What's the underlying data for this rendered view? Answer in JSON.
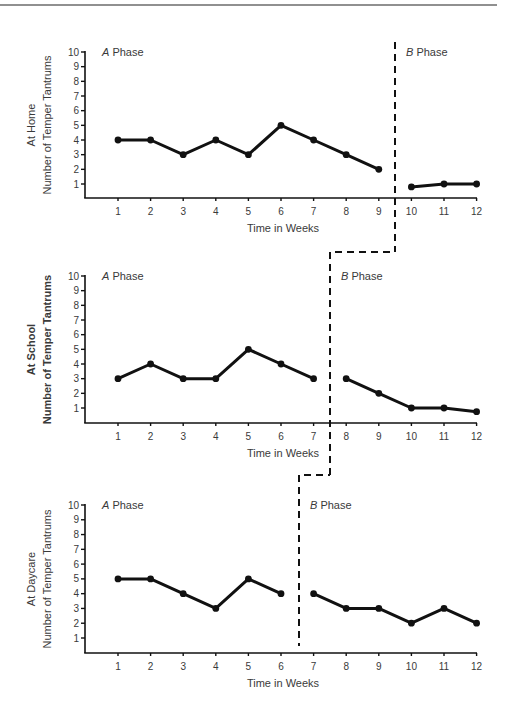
{
  "figure": {
    "top_rule_color": "#6b6b6b",
    "line_color": "#111111",
    "text_color": "#3a3a3a"
  },
  "chart_data": [
    {
      "type": "line",
      "title": "At Home",
      "ylabel_line1": "At Home",
      "ylabel_line2": "Number of Temper Tantrums",
      "ylabel_bold": false,
      "xlabel": "Time in Weeks",
      "ylim": [
        0,
        10
      ],
      "yticks": [
        1,
        2,
        3,
        4,
        5,
        6,
        7,
        8,
        9,
        10
      ],
      "xticks": [
        1,
        2,
        3,
        4,
        5,
        6,
        7,
        8,
        9,
        10,
        11,
        12
      ],
      "grid": false,
      "phase_change_after_week": 9,
      "phases": [
        {
          "name": "A Phase",
          "letter": "A",
          "suffix": " Phase",
          "weeks": [
            1,
            2,
            3,
            4,
            5,
            6,
            7,
            8,
            9
          ],
          "values": [
            4,
            4,
            3,
            4,
            3,
            5,
            4,
            3,
            2
          ]
        },
        {
          "name": "B Phase",
          "letter": "B",
          "suffix": " Phase",
          "weeks": [
            10,
            11,
            12
          ],
          "values": [
            0.8,
            1,
            1
          ]
        }
      ]
    },
    {
      "type": "line",
      "title": "At School",
      "ylabel_line1": "At School",
      "ylabel_line2": "Number of Temper Tantrums",
      "ylabel_bold": true,
      "xlabel": "Time in Weeks",
      "ylim": [
        0,
        10
      ],
      "yticks": [
        1,
        2,
        3,
        4,
        5,
        6,
        7,
        8,
        9,
        10
      ],
      "xticks": [
        1,
        2,
        3,
        4,
        5,
        6,
        7,
        8,
        9,
        10,
        11,
        12
      ],
      "grid": false,
      "phase_change_after_week": 7,
      "phases": [
        {
          "name": "A Phase",
          "letter": "A",
          "suffix": " Phase",
          "weeks": [
            1,
            2,
            3,
            4,
            5,
            6,
            7
          ],
          "values": [
            3,
            4,
            3,
            3,
            5,
            4,
            3
          ]
        },
        {
          "name": "B Phase",
          "letter": "B",
          "suffix": " Phase",
          "weeks": [
            8,
            9,
            10,
            11,
            12
          ],
          "values": [
            3,
            2,
            1,
            1,
            0.75
          ]
        }
      ]
    },
    {
      "type": "line",
      "title": "At Daycare",
      "ylabel_line1": "At Daycare",
      "ylabel_line2": "Number of Temper Tantrums",
      "ylabel_bold": false,
      "xlabel": "Time in Weeks",
      "ylim": [
        0,
        10
      ],
      "yticks": [
        1,
        2,
        3,
        4,
        5,
        6,
        7,
        8,
        9,
        10
      ],
      "xticks": [
        1,
        2,
        3,
        4,
        5,
        6,
        7,
        8,
        9,
        10,
        11,
        12
      ],
      "grid": false,
      "phase_change_after_week": 6,
      "phases": [
        {
          "name": "A Phase",
          "letter": "A",
          "suffix": " Phase",
          "weeks": [
            1,
            2,
            3,
            4,
            5,
            6
          ],
          "values": [
            5,
            5,
            4,
            3,
            5,
            4
          ]
        },
        {
          "name": "B Phase",
          "letter": "B",
          "suffix": " Phase",
          "weeks": [
            7,
            8,
            9,
            10,
            11,
            12
          ],
          "values": [
            4,
            3,
            3,
            2,
            3,
            2
          ]
        }
      ]
    }
  ],
  "layout": {
    "panels": [
      {
        "y10": 52,
        "y1": 184,
        "base": 198,
        "phase_line": {
          "x": 395,
          "top": 42,
          "bottom": 252
        },
        "ylab_x1": 35,
        "ylab_x2": 51
      },
      {
        "y10": 276,
        "y1": 408,
        "base": 423,
        "phase_line": {
          "x": 330,
          "top": 252,
          "bottom": 475
        },
        "ylab_x1": 35,
        "ylab_x2": 51
      },
      {
        "y10": 505,
        "y1": 638,
        "base": 653,
        "phase_line": {
          "x": 299,
          "top": 475,
          "bottom": 646
        },
        "ylab_x1": 35,
        "ylab_x2": 51
      }
    ],
    "axis_x": 85,
    "week1_x": 118,
    "week_step": 32.6,
    "axis_right": 477
  }
}
